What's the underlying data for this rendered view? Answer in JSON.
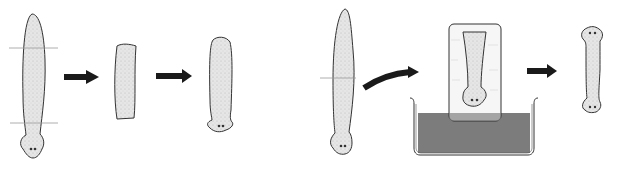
{
  "diagram": {
    "description": "Planarian regeneration experiment diagram (two sequences)",
    "colors": {
      "outline": "#333333",
      "body_fill": "#e4e4e4",
      "arrow": "#1a1a1a",
      "cut_line": "#9a9a9a",
      "liquid": "#7c7c7c",
      "block": "#f4f4f4"
    },
    "panels": [
      {
        "id": "left",
        "steps": [
          "whole-worm-with-two-cuts",
          "middle-fragment",
          "regenerated-worm-single-head"
        ]
      },
      {
        "id": "right",
        "steps": [
          "whole-worm-with-one-cut",
          "tail-fragment-in-block-over-bath",
          "regenerated-worm-two-heads"
        ]
      }
    ],
    "arrows": [
      {
        "from": "whole-worm-with-two-cuts",
        "to": "middle-fragment",
        "style": "straight"
      },
      {
        "from": "middle-fragment",
        "to": "regenerated-worm-single-head",
        "style": "straight"
      },
      {
        "from": "whole-worm-with-one-cut",
        "to": "tail-fragment-in-block-over-bath",
        "style": "curved"
      },
      {
        "from": "tail-fragment-in-block-over-bath",
        "to": "regenerated-worm-two-heads",
        "style": "straight"
      }
    ]
  }
}
